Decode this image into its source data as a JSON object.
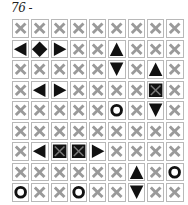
{
  "puzzle": {
    "number_label": "76 -",
    "columns": 9,
    "rows": 9,
    "legend": {
      "x": "empty-water",
      "left": "ship-end-left",
      "right": "ship-end-right",
      "up": "ship-end-top",
      "down": "ship-end-bottom",
      "diamond": "ship-middle",
      "square": "ship-middle-square",
      "circle": "submarine"
    },
    "grid": [
      [
        "x",
        "x",
        "x",
        "x",
        "x",
        "x",
        "x",
        "x",
        "x"
      ],
      [
        "left",
        "diamond",
        "right",
        "x",
        "x",
        "up",
        "x",
        "x",
        "x"
      ],
      [
        "x",
        "x",
        "x",
        "x",
        "x",
        "down",
        "x",
        "up",
        "x"
      ],
      [
        "x",
        "left",
        "right",
        "x",
        "x",
        "x",
        "x",
        "square",
        "x"
      ],
      [
        "x",
        "x",
        "x",
        "x",
        "x",
        "circle",
        "x",
        "down",
        "x"
      ],
      [
        "x",
        "x",
        "x",
        "x",
        "x",
        "x",
        "x",
        "x",
        "x"
      ],
      [
        "x",
        "left",
        "square",
        "square",
        "right",
        "x",
        "x",
        "x",
        "x"
      ],
      [
        "x",
        "x",
        "x",
        "x",
        "x",
        "x",
        "up",
        "x",
        "circle"
      ],
      [
        "circle",
        "x",
        "x",
        "circle",
        "x",
        "x",
        "down",
        "x",
        "x"
      ]
    ],
    "colors": {
      "x_stroke": "#9a9a9a",
      "cell_border": "#b8b8b8",
      "ship_fill": "#111111"
    }
  }
}
